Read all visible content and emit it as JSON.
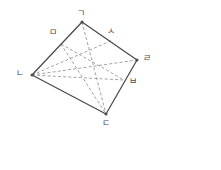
{
  "figure": {
    "stroke_solid": "#4a4a4a",
    "stroke_dashed": "#8a8a8a",
    "background": "#ffffff",
    "vertices": [
      {
        "id": "A",
        "label": "ㄱ",
        "x": 82,
        "y": 22,
        "label_x": 77,
        "label_y": 9,
        "type": "vertex"
      },
      {
        "id": "B",
        "label": "ㄴ",
        "x": 32,
        "y": 75,
        "label_x": 16,
        "label_y": 69,
        "type": "vertex"
      },
      {
        "id": "C",
        "label": "ㄷ",
        "x": 106,
        "y": 114,
        "label_x": 102,
        "label_y": 119,
        "type": "vertex"
      },
      {
        "id": "D",
        "label": "ㄹ",
        "x": 137,
        "y": 60,
        "label_x": 143,
        "label_y": 54,
        "type": "vertex"
      },
      {
        "id": "M",
        "label": "ㅁ",
        "x": 61,
        "y": 44,
        "label_x": 49,
        "label_y": 28,
        "type": "point"
      },
      {
        "id": "S",
        "label": "ㅅ",
        "x": 113,
        "y": 40,
        "label_x": 107,
        "label_y": 27,
        "type": "point"
      },
      {
        "id": "P",
        "label": "ㅂ",
        "x": 124,
        "y": 80,
        "label_x": 129,
        "label_y": 77,
        "type": "point"
      }
    ],
    "solid_edges": [
      {
        "name": "edge-ga-na",
        "from": "A",
        "to": "B"
      },
      {
        "name": "edge-na-da",
        "from": "B",
        "to": "C"
      },
      {
        "name": "edge-da-ra",
        "from": "C",
        "to": "D"
      },
      {
        "name": "edge-ra-ga",
        "from": "D",
        "to": "A"
      }
    ],
    "dashed_edges": [
      {
        "name": "dash-na-sa",
        "from": "B",
        "to": "S"
      },
      {
        "name": "dash-na-ra",
        "from": "B",
        "to": "D"
      },
      {
        "name": "dash-na-ba",
        "from": "B",
        "to": "P"
      },
      {
        "name": "dash-ga-da",
        "from": "A",
        "to": "C"
      },
      {
        "name": "dash-ma-da",
        "from": "M",
        "to": "C"
      },
      {
        "name": "dash-ma-ba",
        "from": "M",
        "to": "P"
      }
    ]
  },
  "answer": {
    "open_paren": "(",
    "close_paren": ")",
    "value": ""
  }
}
